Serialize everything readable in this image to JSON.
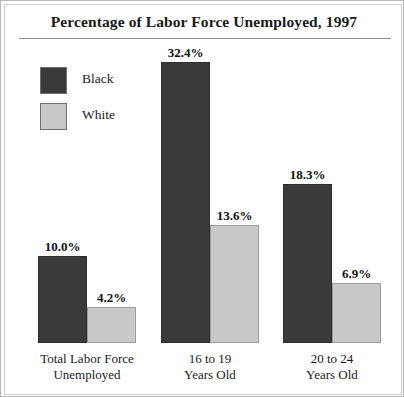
{
  "chart_data": {
    "type": "bar",
    "title": "Percentage of Labor Force Unemployed, 1997",
    "xlabel": "",
    "ylabel": "",
    "ylim": [
      0,
      32.4
    ],
    "grid": false,
    "legend_position": "top-left",
    "categories": [
      "Total Labor Force\nUnemployed",
      "16 to 19\nYears Old",
      "20 to 24\nYears Old"
    ],
    "category_lines": [
      [
        "Total Labor Force",
        "Unemployed"
      ],
      [
        "16 to 19",
        "Years Old"
      ],
      [
        "20 to 24",
        "Years Old"
      ]
    ],
    "series": [
      {
        "name": "Black",
        "color": "#3a3a3a",
        "values": [
          10.0,
          32.4,
          18.3
        ],
        "labels": [
          "10.0%",
          "32.4%",
          "18.3%"
        ]
      },
      {
        "name": "White",
        "color": "#c9c9c9",
        "values": [
          4.2,
          13.6,
          6.9
        ],
        "labels": [
          "4.2%",
          "13.6%",
          "6.9%"
        ]
      }
    ]
  },
  "legend": {
    "items": [
      {
        "label": "Black",
        "color": "#3a3a3a"
      },
      {
        "label": "White",
        "color": "#c9c9c9"
      }
    ]
  },
  "colors": {
    "black_series": "#3a3a3a",
    "white_series": "#c9c9c9",
    "frame": "#b9b9b9",
    "rule": "#8c8c8c",
    "text": "#1a1a1a"
  }
}
